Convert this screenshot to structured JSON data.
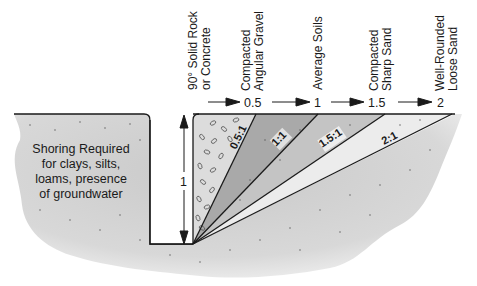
{
  "diagram": {
    "type": "excavation-slope-diagram",
    "vertical_label": "1",
    "soil_types": [
      {
        "line1": "90° Solid Rock",
        "line2": "or Concrete",
        "run": "0"
      },
      {
        "line1": "Compacted",
        "line2": "Angular Gravel",
        "run": "0.5"
      },
      {
        "line1": "Average Soils",
        "line2": "",
        "run": "1"
      },
      {
        "line1": "Compacted",
        "line2": "Sharp Sand",
        "run": "1.5"
      },
      {
        "line1": "Well-Rounded",
        "line2": "Loose Sand",
        "run": "2"
      }
    ],
    "run_labels": [
      "0.5",
      "1",
      "1.5",
      "2"
    ],
    "slope_ratios": [
      "0.5:1",
      "1:1",
      "1.5:1",
      "2:1"
    ],
    "shoring_note": [
      "Shoring Required",
      "for clays, silts,",
      "loams, presence",
      "of groundwater"
    ],
    "colors": {
      "ground": "#d4d4d4",
      "gravel_zone": "#d9d9d9",
      "zone_1": "#a8a8a8",
      "zone_2": "#c2c2c2",
      "zone_3": "#e6e6e6",
      "zone_4": "#f2f2f2",
      "line": "#1a1a1a"
    }
  }
}
